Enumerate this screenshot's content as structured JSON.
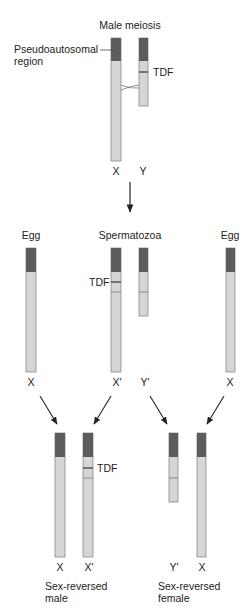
{
  "titles": {
    "top": "Male meiosis",
    "egg_left": "Egg",
    "sperm": "Spermatozoa",
    "egg_right": "Egg"
  },
  "annotations": {
    "pseudoautosomal_line1": "Pseudoautosomal",
    "pseudoautosomal_line2": "region",
    "tdf_top": "TDF",
    "tdf_mid": "TDF",
    "tdf_bottom": "TDF"
  },
  "chromosome_labels": {
    "top_x": "X",
    "top_y": "Y",
    "mid_egg_left": "X",
    "mid_sperm_x": "X'",
    "mid_sperm_y": "Y'",
    "mid_egg_right": "X",
    "bottom_male_x": "X",
    "bottom_male_xprime": "X'",
    "bottom_female_yprime": "Y'",
    "bottom_female_x": "X"
  },
  "captions": {
    "male_line1": "Sex-reversed",
    "male_line2": "male",
    "female_line1": "Sex-reversed",
    "female_line2": "female"
  },
  "colors": {
    "pseudoautosomal": "#5c5c5c",
    "chromosome_body": "#d6d6d6",
    "outline": "#8a8a8a",
    "arrow": "#222222"
  }
}
